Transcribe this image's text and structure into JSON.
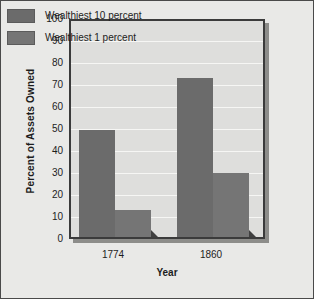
{
  "chart_data": {
    "type": "bar",
    "title": "",
    "xlabel": "Year",
    "ylabel": "Percent of Assets Owned",
    "categories": [
      "1774",
      "1860"
    ],
    "series": [
      {
        "name": "Wealthiest 10 percent",
        "color": "#6b6b6b",
        "values": [
          48.5,
          72.5
        ]
      },
      {
        "name": "Wealthiest 1 percent",
        "color": "#757575",
        "values": [
          12.5,
          29.0
        ]
      }
    ],
    "ylim": [
      0,
      100
    ],
    "yticks": [
      0,
      10,
      20,
      30,
      40,
      50,
      60,
      70,
      80,
      90,
      100
    ],
    "ytick_labels": [
      "0",
      "10",
      "20",
      "30",
      "40",
      "50",
      "60",
      "70",
      "80",
      "90",
      "100"
    ],
    "grid": true,
    "legend_position": "top-left",
    "plot_background": "#dededc",
    "figure_background": "#e9e9e7",
    "gridline_color": "#f6f6f4",
    "border_color": "#3b3b3b",
    "shadow_color": "#3f3f3f"
  },
  "legend": {
    "items": [
      {
        "label": "Wealthiest 10 percent",
        "color": "#6b6b6b"
      },
      {
        "label": "Wealthiest 1 percent",
        "color": "#757575"
      }
    ]
  }
}
